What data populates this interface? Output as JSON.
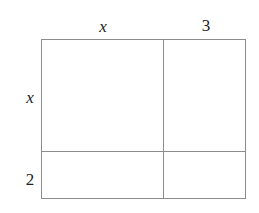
{
  "diagram": {
    "type": "area-model",
    "top_labels": [
      {
        "text": "x",
        "italic": true
      },
      {
        "text": "3",
        "italic": false
      }
    ],
    "side_labels": [
      {
        "text": "x",
        "italic": true
      },
      {
        "text": "2",
        "italic": false
      }
    ],
    "cells": [
      {
        "row": 0,
        "col": 0,
        "text": ""
      },
      {
        "row": 0,
        "col": 1,
        "text": ""
      },
      {
        "row": 1,
        "col": 0,
        "text": ""
      },
      {
        "row": 1,
        "col": 1,
        "text": ""
      }
    ],
    "line_color": "#8c8c8c",
    "text_color": "#222222"
  }
}
